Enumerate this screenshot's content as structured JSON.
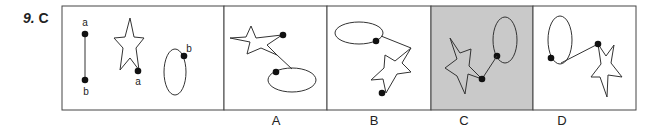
{
  "question": {
    "number": "9.",
    "answer": "C"
  },
  "given": {
    "line_labels": {
      "top": "a",
      "bottom": "b"
    },
    "star_label": "a",
    "ellipse_label": "b"
  },
  "options": [
    {
      "label": "A",
      "selected": false
    },
    {
      "label": "B",
      "selected": false
    },
    {
      "label": "C",
      "selected": true
    },
    {
      "label": "D",
      "selected": false
    }
  ],
  "colors": {
    "stroke": "#333333",
    "selected_fill": "#c9c9c9",
    "panel_fill": "#ffffff"
  }
}
